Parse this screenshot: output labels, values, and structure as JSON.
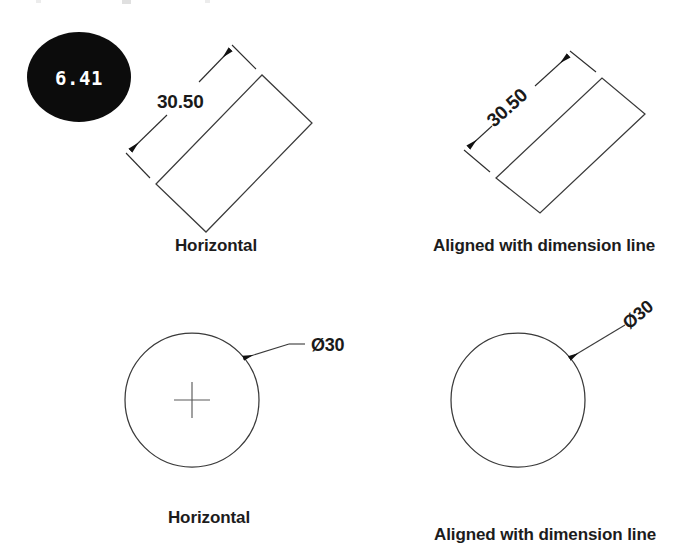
{
  "page": {
    "background_color": "#ffffff",
    "width": 690,
    "height": 555,
    "line_color": "#3a3a3a",
    "text_color": "#1a1a1a"
  },
  "badge": {
    "value": "6.41",
    "background_color": "#0c0c0c",
    "text_color": "#ffffff"
  },
  "panels": [
    {
      "id": "rect-horizontal",
      "shape": "rectangle",
      "dimension_value": "30.50",
      "dimension_text_orientation": "horizontal",
      "caption": "Horizontal"
    },
    {
      "id": "rect-aligned",
      "shape": "rectangle",
      "dimension_value": "30.50",
      "dimension_text_orientation": "aligned",
      "caption": "Aligned with dimension line"
    },
    {
      "id": "circle-horizontal",
      "shape": "circle",
      "dimension_value": "Ø30",
      "dimension_text_orientation": "horizontal",
      "caption": "Horizontal",
      "has_center_mark": true
    },
    {
      "id": "circle-aligned",
      "shape": "circle",
      "dimension_value": "Ø30",
      "dimension_text_orientation": "aligned",
      "caption": "Aligned with dimension line",
      "has_center_mark": false
    }
  ]
}
